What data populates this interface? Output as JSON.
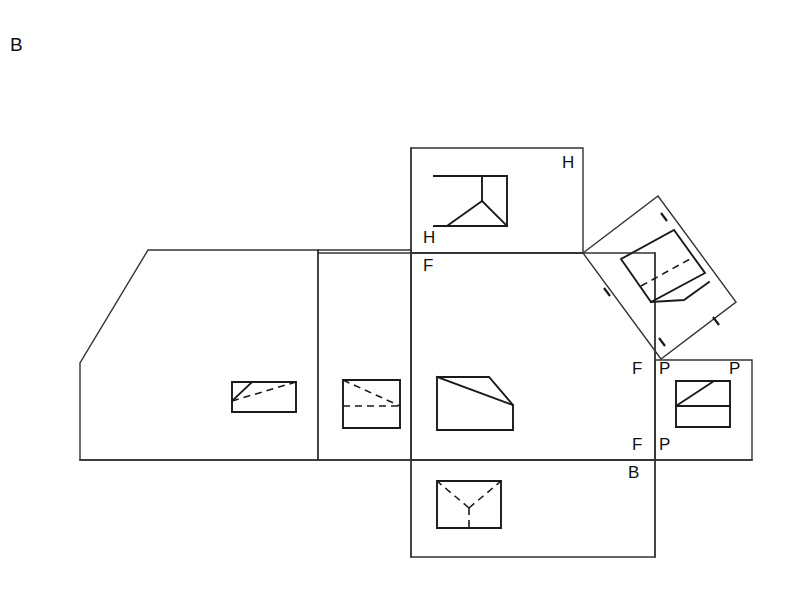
{
  "figure": {
    "id_label": "B",
    "background_color": "#ffffff",
    "line_color": "#333333",
    "view_line_color": "#1a1a1a",
    "width": 795,
    "height": 598
  },
  "plane_labels": {
    "horizontal_top_right": "H",
    "horizontal_bottom_left": "H",
    "frontal_below_fold": "F",
    "frontal_left_of_profile_top": "F",
    "frontal_left_of_profile_bottom": "F",
    "profile_top_left": "P",
    "profile_top_right": "P",
    "profile_bottom_left": "P",
    "bottom_plane": "B"
  },
  "panels": [
    {
      "name": "left-rear-panel",
      "kind": "polygon-panel",
      "description": "Large left panel with chamfered upper-left corner",
      "points": "148,250 318,250 318,460 80,460 80,363"
    },
    {
      "name": "left-middle-panel",
      "kind": "rect-panel",
      "description": "Narrow middle panel between rear and front views",
      "points": "318,250 411,250 411,460 318,460"
    },
    {
      "name": "horizontal-top-panel",
      "kind": "rect-panel",
      "description": "Top horizontal plane panel labeled H",
      "points": "411,148 583,148 583,253 411,253"
    },
    {
      "name": "frontal-center-panel",
      "kind": "rect-panel",
      "description": "Center frontal plane panel labeled F",
      "points": "411,253 655,253 655,460 411,460"
    },
    {
      "name": "profile-right-panel",
      "kind": "rect-panel",
      "description": "Right profile plane panel labeled P",
      "points": "655,360 752,360 752,460 655,460"
    },
    {
      "name": "bottom-panel",
      "kind": "rect-panel",
      "description": "Bottom plane panel labeled B",
      "points": "411,460 655,460 655,557 411,557"
    },
    {
      "name": "rotated-auxiliary-panel",
      "kind": "rotated-panel",
      "description": "Auxiliary inclined plane panel rotated about 40 degrees",
      "points": "583,253 658,196 736,302 661,359"
    }
  ],
  "views": [
    {
      "name": "rear-view-figure",
      "panel": "left-rear-panel",
      "description": "Chamfered block, rear view with hidden diagonal",
      "solid": "232,412 232,382 252,382 296,382 296,412 232,412",
      "solid_extra": "252,382 232,401",
      "hidden": "232,401 296,382"
    },
    {
      "name": "side-view-figure",
      "panel": "left-middle-panel",
      "description": "Square view with hidden horizontal and hidden diagonal",
      "solid": "343,380 400,380 400,428 343,428 343,380",
      "hidden_h": "343,406 400,406",
      "hidden_d": "343,380 400,406"
    },
    {
      "name": "front-view-figure",
      "panel": "frontal-center-panel",
      "description": "Chamfered block front view with visible chamfer diagonal",
      "solid": "437,377 489,377 513,405 513,430 437,430 437,377",
      "solid_extra": "437,377 513,405"
    },
    {
      "name": "top-view-figure",
      "panel": "horizontal-top-panel",
      "description": "Top view with solid Y-shaped junction lines",
      "solid": "434,176 507,176 507,226 434,226 434,226",
      "solid_v": "482,176 482,201",
      "solid_d1": "482,201 447,226",
      "solid_d2": "482,201 507,226"
    },
    {
      "name": "bottom-view-figure",
      "panel": "bottom-panel",
      "description": "Bottom view with hidden Y-shaped junction lines",
      "solid": "437,481 501,481 501,528 437,528 437,481",
      "hidden_v": "469,508 469,528",
      "hidden_d1": "469,508 437,481",
      "hidden_d2": "469,508 501,481"
    },
    {
      "name": "profile-view-figure",
      "panel": "profile-right-panel",
      "description": "Profile view square with diagonal and horizontal divider",
      "solid": "676,381 730,381 730,427 676,427 676,381",
      "solid_h": "676,406 730,406",
      "solid_d": "676,406 714,381"
    },
    {
      "name": "auxiliary-view-figure",
      "panel": "rotated-auxiliary-panel",
      "description": "Auxiliary true-shape view of the inclined chamfer face",
      "solid_outline": "621,259 674,230 705,273 651,302 621,259",
      "solid_lower": "651,302 684,300 709,282",
      "hidden_diag": "641,286 690,259"
    }
  ],
  "tick_marks": [
    {
      "name": "tick-top",
      "points": "661,213 667,221"
    },
    {
      "name": "tick-right",
      "points": "713,317 719,325"
    },
    {
      "name": "tick-bottom",
      "points": "659,338 665,346"
    },
    {
      "name": "tick-left",
      "points": "604,288 610,296"
    }
  ],
  "fold_lines": [
    {
      "name": "fold-h-f-vertical",
      "points": "411,148 411,557"
    },
    {
      "name": "fold-f-main-horizontal",
      "points": "80,460 752,460"
    },
    {
      "name": "fold-h-f-horizontal",
      "points": "318,253 583,253"
    },
    {
      "name": "fold-p-vertical",
      "points": "655,253 655,557"
    }
  ]
}
